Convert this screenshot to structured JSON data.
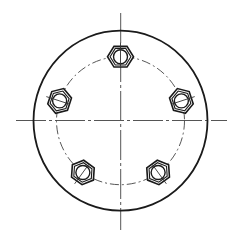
{
  "drawing": {
    "title": "",
    "background": "#ffffff",
    "line_color": "#1a1a1a",
    "center_line_color": "#555555",
    "flange": {
      "cx": 120.5,
      "cy": 120.7,
      "rx": 87,
      "ry": 90
    },
    "center_lines": {
      "horizontal": {
        "x1": 16,
        "x2": 227,
        "y": 120.5
      },
      "vertical": {
        "x": 120.7,
        "y1": 13,
        "y2": 230
      }
    },
    "bolt_circle": {
      "r": 64
    },
    "bolts": [
      {
        "angle_deg": 90,
        "label": "bolt-top"
      },
      {
        "angle_deg": 162,
        "label": "bolt-left"
      },
      {
        "angle_deg": 234,
        "label": "bolt-bottom-left"
      },
      {
        "angle_deg": 306,
        "label": "bolt-bottom-right"
      },
      {
        "angle_deg": 18,
        "label": "bolt-right"
      }
    ],
    "nut": {
      "hex_r": 13,
      "hole_r": 7
    }
  }
}
